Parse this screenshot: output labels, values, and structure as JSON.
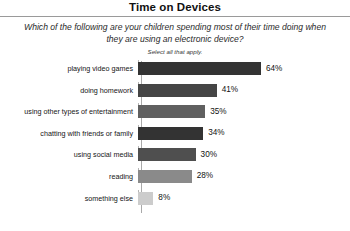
{
  "header": {
    "title": "Time on Devices",
    "subtitle": "Which of the following are your children spending most of their time doing when they are using an electronic device?",
    "note": "Select all that apply."
  },
  "chart_data": {
    "type": "bar",
    "orientation": "horizontal",
    "title": "Time on Devices",
    "subtitle": "Which of the following are your children spending most of their time doing when they are using an electronic device?",
    "annotation": "Select all that apply.",
    "xlabel": "",
    "ylabel": "",
    "xlim": [
      0,
      70
    ],
    "grid": false,
    "legend": null,
    "value_suffix": "%",
    "categories": [
      "playing video games",
      "doing homework",
      "using other types of entertainment",
      "chatting with friends or family",
      "using social media",
      "reading",
      "something else"
    ],
    "values": [
      64,
      41,
      35,
      34,
      30,
      28,
      8
    ],
    "value_labels": [
      "64%",
      "41%",
      "35%",
      "34%",
      "30%",
      "28%",
      "8%"
    ],
    "bar_colors": [
      "#333333",
      "#454545",
      "#606060",
      "#333333",
      "#4f4f4f",
      "#8a8a8a",
      "#cccccc"
    ],
    "bars": [
      {
        "label": "playing video games",
        "value": 64,
        "value_label": "64%",
        "color": "#333333"
      },
      {
        "label": "doing homework",
        "value": 41,
        "value_label": "41%",
        "color": "#454545"
      },
      {
        "label": "using other types of entertainment",
        "value": 35,
        "value_label": "35%",
        "color": "#606060"
      },
      {
        "label": "chatting with friends or family",
        "value": 34,
        "value_label": "34%",
        "color": "#333333"
      },
      {
        "label": "using social media",
        "value": 30,
        "value_label": "30%",
        "color": "#4f4f4f"
      },
      {
        "label": "reading",
        "value": 28,
        "value_label": "28%",
        "color": "#8a8a8a"
      },
      {
        "label": "something else",
        "value": 8,
        "value_label": "8%",
        "color": "#cccccc"
      }
    ]
  }
}
